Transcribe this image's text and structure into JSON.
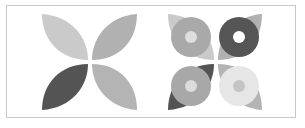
{
  "figure": {
    "left_motif": {
      "petals": [
        {
          "position": "top-left",
          "color": "#cacaca"
        },
        {
          "position": "top-right",
          "color": "#b1b1b1"
        },
        {
          "position": "bottom-left",
          "color": "#545454"
        },
        {
          "position": "bottom-right",
          "color": "#b4b4b4"
        }
      ]
    },
    "right_motif": {
      "petals": [
        {
          "position": "top-left",
          "color": "#cacaca",
          "ring_color": "#a9a9a9",
          "hole_color": "#dedede"
        },
        {
          "position": "top-right",
          "color": "#b1b1b1",
          "ring_color": "#555555",
          "hole_color": "#ffffff"
        },
        {
          "position": "bottom-left",
          "color": "#545454",
          "ring_color": "#a8a8a8",
          "hole_color": "#dcdcdc"
        },
        {
          "position": "bottom-right",
          "color": "#b4b4b4",
          "ring_color": "#e6e6e6",
          "hole_color": "#c4c4c4"
        }
      ]
    },
    "frame_color": "#c9c9c9",
    "background": "#ffffff"
  }
}
